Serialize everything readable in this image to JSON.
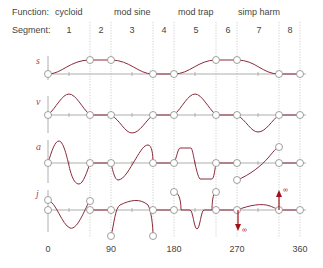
{
  "header": {
    "function_label": "Function:",
    "segment_label": "Segment:",
    "functions": [
      {
        "name": "cycloid",
        "x": 54
      },
      {
        "name": "mod sine",
        "x": 113
      },
      {
        "name": "mod trap",
        "x": 177
      },
      {
        "name": "simp harm",
        "x": 237
      }
    ],
    "segments": [
      {
        "label": "1",
        "x": 69
      },
      {
        "label": "2",
        "x": 100
      },
      {
        "label": "3",
        "x": 132
      },
      {
        "label": "4",
        "x": 163
      },
      {
        "label": "5",
        "x": 195
      },
      {
        "label": "6",
        "x": 226
      },
      {
        "label": "7",
        "x": 258
      },
      {
        "label": "8",
        "x": 289
      }
    ]
  },
  "axes": [
    {
      "symbol": "s",
      "y": 63
    },
    {
      "symbol": "v",
      "y": 102
    },
    {
      "symbol": "a",
      "y": 147
    },
    {
      "symbol": "j",
      "y": 193
    }
  ],
  "x_ticks": [
    {
      "label": "0",
      "x": 48
    },
    {
      "label": "90",
      "x": 111
    },
    {
      "label": "180",
      "x": 174
    },
    {
      "label": "270",
      "x": 237
    },
    {
      "label": "360",
      "x": 300
    }
  ],
  "annotations": {
    "infinity_up": "∞",
    "infinity_down": "∞"
  },
  "colors": {
    "curve": "#8b2a3a",
    "axis": "#999999",
    "grid": "#bbbbbb",
    "arrow": "#a0101a",
    "label": "#b0405a"
  }
}
